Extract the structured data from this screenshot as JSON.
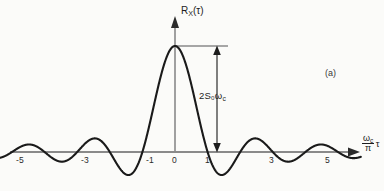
{
  "figure": {
    "panel_label": "(a)",
    "y_axis_label_main": "R",
    "y_axis_label_sub": "X",
    "y_axis_label_arg": "(τ)",
    "x_axis_label_numerator": "ω",
    "x_axis_label_numerator_sub": "c",
    "x_axis_label_denominator": "π",
    "x_axis_label_variable": "τ",
    "amplitude_annotation": "2S₀ω",
    "amplitude_annotation_sub": "c",
    "curve_color": "#1a1a1a",
    "axis_color": "#888888",
    "background_color": "#fbfbf9"
  },
  "chart_data": {
    "type": "line",
    "title": "",
    "subtitle": "",
    "xlabel": "(ωc/π) τ",
    "ylabel": "R_X(τ)",
    "xlim": [
      -5.6,
      5.7
    ],
    "ylim": [
      -0.28,
      1.08
    ],
    "grid": false,
    "legend": null,
    "annotations": [
      {
        "text": "2S₀ωc",
        "kind": "double-headed-vertical-arrow",
        "x": 1.3,
        "y_from": 0.0,
        "y_to": 1.0,
        "description": "peak amplitude of the autocorrelation equals 2 S0 omega_c"
      },
      {
        "text": "(a)",
        "kind": "panel-tag",
        "x": 4.6,
        "y": 0.62
      }
    ],
    "x_ticks": [
      -5,
      -3,
      -1,
      0,
      1,
      3,
      5
    ],
    "x_tick_labels": [
      "-5",
      "-3",
      "-1",
      "0",
      "1",
      "3",
      "5"
    ],
    "y_ticks": [],
    "y_tick_labels": [],
    "function": "sinc(x) = sin(pi*x)/(pi*x), normalized peak = 1 at x = 0",
    "series": [
      {
        "name": "R_X(τ)",
        "x": [
          -5.6,
          -5.4,
          -5.2,
          -5.0,
          -4.8,
          -4.6,
          -4.4,
          -4.2,
          -4.0,
          -3.8,
          -3.6,
          -3.4,
          -3.2,
          -3.0,
          -2.8,
          -2.6,
          -2.4,
          -2.2,
          -2.0,
          -1.8,
          -1.6,
          -1.4,
          -1.2,
          -1.0,
          -0.8,
          -0.6,
          -0.4,
          -0.2,
          0.0,
          0.2,
          0.4,
          0.6,
          0.8,
          1.0,
          1.2,
          1.4,
          1.6,
          1.8,
          2.0,
          2.2,
          2.4,
          2.6,
          2.8,
          3.0,
          3.2,
          3.4,
          3.6,
          3.8,
          4.0,
          4.2,
          4.4,
          4.6,
          4.8,
          5.0,
          5.2,
          5.4,
          5.6
        ],
        "y": [
          -0.033,
          -0.053,
          -0.048,
          0.0,
          0.061,
          0.103,
          0.105,
          0.062,
          0.0,
          -0.062,
          -0.105,
          -0.108,
          -0.064,
          0.0,
          0.067,
          0.115,
          0.12,
          0.072,
          0.0,
          -0.078,
          -0.137,
          -0.147,
          -0.09,
          0.0,
          0.117,
          0.234,
          0.757,
          0.935,
          1.0,
          0.935,
          0.757,
          0.505,
          0.234,
          0.0,
          -0.156,
          -0.216,
          -0.189,
          -0.104,
          0.0,
          0.078,
          0.126,
          0.133,
          0.084,
          0.0,
          -0.073,
          -0.124,
          -0.131,
          -0.083,
          0.0,
          0.069,
          0.117,
          0.124,
          0.079,
          0.0,
          -0.058,
          -0.1,
          -0.107
        ]
      }
    ]
  }
}
